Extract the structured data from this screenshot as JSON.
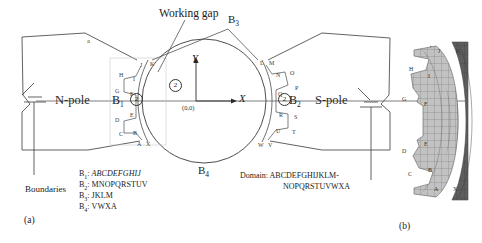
{
  "figure": {
    "caption_a": "(a)",
    "caption_b": "(b)",
    "annotations": {
      "working_gap": "Working gap",
      "n_pole": "N-pole",
      "s_pole": "S-pole",
      "axis_x": "X",
      "axis_y": "Y",
      "origin": "(0,0)",
      "region_marker": "2",
      "small_a": "a"
    },
    "boundary_labels": {
      "b1": "B",
      "b1_sub": "1",
      "b2": "B",
      "b2_sub": "2",
      "b3": "B",
      "b3_sub": "3",
      "b4": "B",
      "b4_sub": "4"
    },
    "legend": {
      "boundaries_title": "Boundaries",
      "rows": [
        {
          "name": "B",
          "sub": "1",
          "sequence": "ABCDEFGHIJ",
          "italic": true
        },
        {
          "name": "B",
          "sub": "2",
          "sequence": "MNOPQRSTUV",
          "italic": false
        },
        {
          "name": "B",
          "sub": "3",
          "sequence": "JKLM",
          "italic": false
        },
        {
          "name": "B",
          "sub": "4",
          "sequence": "VWXA",
          "italic": false
        }
      ],
      "domain_title": "Domain:",
      "domain_line1": "ABCDEFGHIJKLM-",
      "domain_line2": "NOPQRSTUVWXA"
    },
    "node_labels_a": [
      {
        "t": "A",
        "x": 137,
        "y": 141
      },
      {
        "t": "X",
        "x": 146,
        "y": 141
      },
      {
        "t": "B",
        "x": 133,
        "y": 130
      },
      {
        "t": "C",
        "x": 119,
        "y": 131
      },
      {
        "t": "D",
        "x": 115,
        "y": 117
      },
      {
        "t": "E",
        "x": 130,
        "y": 112
      },
      {
        "t": "F",
        "x": 130,
        "y": 91
      },
      {
        "t": "G",
        "x": 115,
        "y": 88
      },
      {
        "t": "H",
        "x": 119,
        "y": 72
      },
      {
        "t": "I",
        "x": 133,
        "y": 76
      },
      {
        "t": "J",
        "x": 140,
        "y": 62
      },
      {
        "t": "K",
        "x": 150,
        "y": 61
      },
      {
        "t": "L",
        "x": 260,
        "y": 60
      },
      {
        "t": "M",
        "x": 269,
        "y": 60
      },
      {
        "t": "N",
        "x": 276,
        "y": 72
      },
      {
        "t": "O",
        "x": 290,
        "y": 70
      },
      {
        "t": "P",
        "x": 295,
        "y": 85
      },
      {
        "t": "Q",
        "x": 278,
        "y": 91
      },
      {
        "t": "R",
        "x": 279,
        "y": 112
      },
      {
        "t": "S",
        "x": 294,
        "y": 114
      },
      {
        "t": "T",
        "x": 292,
        "y": 129
      },
      {
        "t": "U",
        "x": 276,
        "y": 128
      },
      {
        "t": "V",
        "x": 268,
        "y": 142
      },
      {
        "t": "W",
        "x": 258,
        "y": 142
      }
    ],
    "node_labels_b": [
      {
        "t": "A",
        "x": 434,
        "y": 186
      },
      {
        "t": "X",
        "x": 453,
        "y": 186
      },
      {
        "t": "B",
        "x": 428,
        "y": 167
      },
      {
        "t": "C",
        "x": 408,
        "y": 171
      },
      {
        "t": "D",
        "x": 402,
        "y": 148
      },
      {
        "t": "E",
        "x": 424,
        "y": 141
      },
      {
        "t": "F",
        "x": 424,
        "y": 101
      },
      {
        "t": "G",
        "x": 402,
        "y": 96
      },
      {
        "t": "H",
        "x": 409,
        "y": 66
      },
      {
        "t": "I",
        "x": 428,
        "y": 73
      },
      {
        "t": "J",
        "x": 438,
        "y": 48
      },
      {
        "t": "K",
        "x": 456,
        "y": 48
      }
    ],
    "colors": {
      "line": "#3a3a3a",
      "mesh_light": "#b9b9b9",
      "mesh_dark": "#5b5b5b",
      "mesh_edge": "#6e6e6e",
      "text": "#1a1a1a"
    }
  }
}
